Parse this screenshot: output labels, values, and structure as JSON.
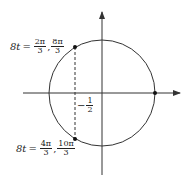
{
  "diagram": {
    "type": "unit-circle",
    "colors": {
      "stroke": "#333333",
      "point": "#111111",
      "background": "#ffffff"
    },
    "circle": {
      "cx": 102,
      "cy": 93,
      "r": 53
    },
    "axes": {
      "horizontal": {
        "x1": 23,
        "x2": 180,
        "y": 93,
        "arrow": "right"
      },
      "vertical": {
        "x": 102,
        "y1": 175,
        "y2": 12,
        "arrow": "up"
      }
    },
    "points": [
      {
        "name": "upper-point",
        "x": 75,
        "y": 47
      },
      {
        "name": "lower-point",
        "x": 75,
        "y": 139
      },
      {
        "name": "right-point",
        "x": 155,
        "y": 93
      }
    ],
    "dashed_line": {
      "x": 75,
      "y1": 47,
      "y2": 139
    }
  },
  "labels": {
    "top": {
      "lhs": "8t",
      "eq": "=",
      "frac1": {
        "num": "2π",
        "den": "3"
      },
      "sep": ",",
      "frac2": {
        "num": "8π",
        "den": "3"
      }
    },
    "half": {
      "sign": "−",
      "num": "1",
      "den": "2"
    },
    "bottom": {
      "lhs": "8t",
      "eq": "=",
      "frac1": {
        "num": "4π",
        "den": "3"
      },
      "sep": ",",
      "frac2": {
        "num": "10π",
        "den": "3"
      }
    }
  }
}
